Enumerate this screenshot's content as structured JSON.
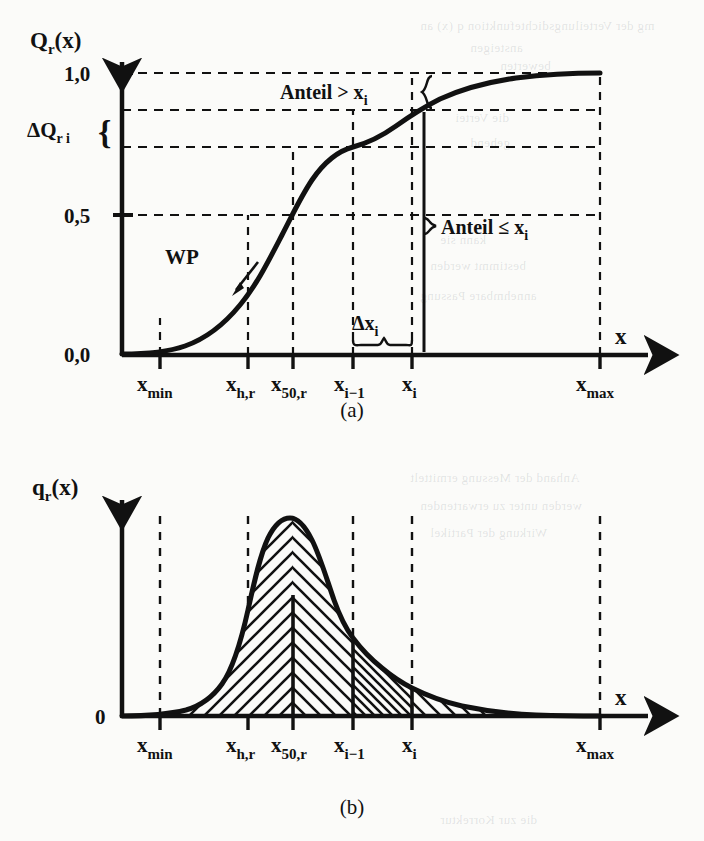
{
  "figure": {
    "caption_a": "(a)",
    "caption_b": "(b)"
  },
  "chart_a": {
    "y_axis_title": "Q",
    "y_axis_title_sub": "r",
    "y_axis_title_arg": "(x)",
    "x_axis_title": "x",
    "y_ticks": [
      "1,0",
      "0,5",
      "0,0"
    ],
    "delta_label": "ΔQ",
    "delta_label_sub": "r i",
    "brace_left": "{",
    "annotation_above": "Anteil > x",
    "annotation_above_sub": "i",
    "annotation_below": "Anteil ≤ x",
    "annotation_below_sub": "i",
    "inflection_label": "WP",
    "delta_x_label": "Δx",
    "delta_x_label_sub": "i",
    "x_ticks": [
      {
        "label": "x",
        "sub": "min"
      },
      {
        "label": "x",
        "sub": "h,r"
      },
      {
        "label": "x",
        "sub": "50,r"
      },
      {
        "label": "x",
        "sub": "i−1"
      },
      {
        "label": "x",
        "sub": "i"
      },
      {
        "label": "x",
        "sub": "max"
      }
    ]
  },
  "chart_b": {
    "y_axis_title": "q",
    "y_axis_title_sub": "r",
    "y_axis_title_arg": "(x)",
    "x_axis_title": "x",
    "y_ticks": [
      "0"
    ],
    "x_ticks": [
      {
        "label": "x",
        "sub": "min"
      },
      {
        "label": "x",
        "sub": "h,r"
      },
      {
        "label": "x",
        "sub": "50,r"
      },
      {
        "label": "x",
        "sub": "i−1"
      },
      {
        "label": "x",
        "sub": "i"
      },
      {
        "label": "x",
        "sub": "max"
      }
    ]
  },
  "chart_data": [
    {
      "type": "line",
      "id": "cumulative-distribution",
      "title": "Q_r(x) cumulative distribution",
      "xlabel": "x",
      "ylabel": "Q_r(x)",
      "ylim": [
        0,
        1.05
      ],
      "ytick_values": [
        0.0,
        0.5,
        1.0
      ],
      "ytick_labels": [
        "0,0",
        "0,5",
        "1,0"
      ],
      "grid": "dashed-horizontal-and-vertical",
      "xtick_labels": [
        "x_min",
        "x_h,r",
        "x_50,r",
        "x_i-1",
        "x_i",
        "x_max"
      ],
      "xtick_positions": [
        0.11,
        0.305,
        0.405,
        0.538,
        0.668,
        1.0
      ],
      "series": [
        {
          "name": "Q_r(x)",
          "x": [
            0.0,
            0.06,
            0.11,
            0.16,
            0.21,
            0.26,
            0.305,
            0.35,
            0.405,
            0.45,
            0.5,
            0.538,
            0.58,
            0.62,
            0.668,
            0.72,
            0.78,
            0.84,
            0.9,
            0.95,
            1.0
          ],
          "y": [
            0.0,
            0.005,
            0.012,
            0.03,
            0.06,
            0.11,
            0.18,
            0.3,
            0.5,
            0.64,
            0.74,
            0.79,
            0.84,
            0.87,
            0.905,
            0.93,
            0.955,
            0.972,
            0.985,
            0.995,
            1.0
          ]
        }
      ],
      "annotations": [
        {
          "text": "WP",
          "note": "inflection point marker near x_h,r"
        },
        {
          "text": "Anteil > x_i",
          "note": "fraction above x_i, between Q=1,0 and Q(x_i)"
        },
        {
          "text": "Anteil ≤ x_i",
          "note": "fraction up to x_i, from 0 to Q(x_i)"
        },
        {
          "text": "ΔQ_ri",
          "note": "class increment between Q(x_i-1) and Q(x_i)"
        },
        {
          "text": "Δx_i",
          "note": "class width between x_i-1 and x_i"
        }
      ]
    },
    {
      "type": "area",
      "id": "density-distribution",
      "title": "q_r(x) density distribution",
      "xlabel": "x",
      "ylabel": "q_r(x)",
      "ylim": [
        0,
        1.0
      ],
      "ytick_values": [
        0
      ],
      "ytick_labels": [
        "0"
      ],
      "grid": "dashed-vertical",
      "xtick_labels": [
        "x_min",
        "x_h,r",
        "x_50,r",
        "x_i-1",
        "x_i",
        "x_max"
      ],
      "xtick_positions": [
        0.11,
        0.305,
        0.405,
        0.538,
        0.668,
        1.0
      ],
      "series": [
        {
          "name": "q_r(x)",
          "x": [
            0.0,
            0.06,
            0.11,
            0.16,
            0.2,
            0.24,
            0.27,
            0.29,
            0.305,
            0.32,
            0.34,
            0.36,
            0.385,
            0.405,
            0.43,
            0.46,
            0.49,
            0.538,
            0.58,
            0.62,
            0.668,
            0.72,
            0.78,
            0.84,
            0.9,
            0.95,
            1.0
          ],
          "y": [
            0.0,
            0.005,
            0.015,
            0.045,
            0.11,
            0.33,
            0.7,
            0.92,
            0.98,
            0.96,
            0.88,
            0.76,
            0.64,
            0.56,
            0.47,
            0.4,
            0.35,
            0.29,
            0.24,
            0.205,
            0.175,
            0.14,
            0.1,
            0.065,
            0.035,
            0.015,
            0.0
          ]
        }
      ],
      "hatched": true,
      "hatch_regions": [
        {
          "from": "x_min",
          "to": "x_50,r",
          "pattern": "backslash"
        },
        {
          "from": "x_50,r",
          "to": "x_i-1",
          "pattern": "slash"
        },
        {
          "from": "x_i-1",
          "to": "x_i",
          "pattern": "slash-dense"
        },
        {
          "from": "x_i",
          "to": "x_max",
          "pattern": "slash"
        }
      ]
    }
  ],
  "background_bleed": [
    {
      "text": "mg der Verteilungsdichtefunktion q (x) an",
      "x": 420,
      "y": 18,
      "size": 13
    },
    {
      "text": "ansteigen",
      "x": 470,
      "y": 40,
      "size": 13
    },
    {
      "text": "bewerten",
      "x": 500,
      "y": 58,
      "size": 13
    },
    {
      "text": "die Vertei",
      "x": 455,
      "y": 110,
      "size": 13
    },
    {
      "text": "gehend",
      "x": 470,
      "y": 135,
      "size": 13
    },
    {
      "text": "kann sie",
      "x": 440,
      "y": 232,
      "size": 13
    },
    {
      "text": "bestimmt werden",
      "x": 430,
      "y": 258,
      "size": 13
    },
    {
      "text": "annehmbare Passung",
      "x": 420,
      "y": 288,
      "size": 13
    },
    {
      "text": "Anhand der Messung ermittelt",
      "x": 410,
      "y": 470,
      "size": 13
    },
    {
      "text": "werden unter zu erwartenden",
      "x": 420,
      "y": 498,
      "size": 13
    },
    {
      "text": "Wirkung der Partikel",
      "x": 430,
      "y": 525,
      "size": 13
    },
    {
      "text": "die zur Korrektur",
      "x": 440,
      "y": 812,
      "size": 13
    }
  ]
}
